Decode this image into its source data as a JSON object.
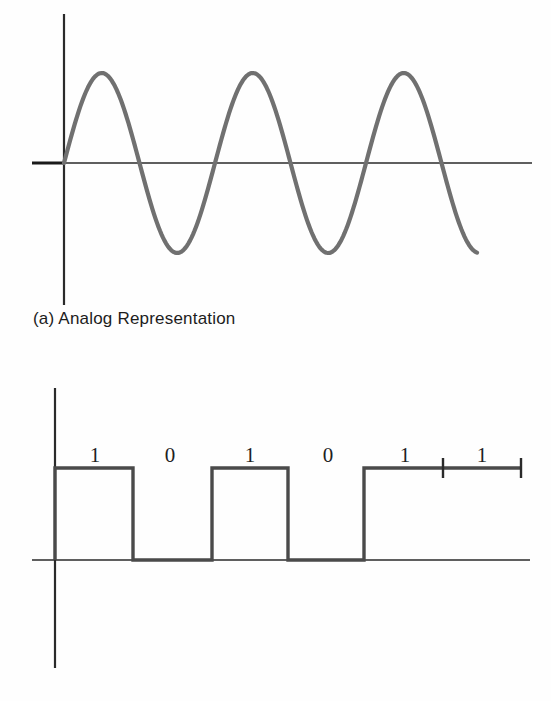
{
  "figure": {
    "background_color": "#fefefe",
    "panels": [
      {
        "id": "analog",
        "caption": "(a) Analog Representation"
      },
      {
        "id": "digital",
        "caption": "(b) Digital Representation"
      }
    ]
  },
  "analog": {
    "caption": "(a) Analog Representation",
    "wave_color": "#707070",
    "axis_color": "#2a2a2a",
    "axis": {
      "x_axis_start_x": 32,
      "x_axis_end_x": 532,
      "x_axis_y": 163,
      "y_axis_x": 64,
      "y_axis_top_y": 14,
      "y_axis_bottom_y": 305
    },
    "waveform": {
      "shape": "sine",
      "cycles": 3,
      "start_x": 64,
      "end_x": 477,
      "period_px": 151,
      "amplitude_px": 90,
      "zero_crossings_x": [
        64,
        138,
        215,
        290,
        368,
        443
      ],
      "peaks_x": [
        97,
        253,
        405
      ],
      "peak_y": 73,
      "troughs_x": [
        176,
        330
      ],
      "trough_y": 250
    }
  },
  "digital": {
    "caption": "(b) Digital Representation",
    "trace_color": "#4a4a4a",
    "axis_color": "#2a2a2a",
    "bits": [
      "1",
      "0",
      "1",
      "0",
      "1",
      "1"
    ],
    "bit_label_x": [
      95,
      170,
      250,
      328,
      405,
      482
    ],
    "bit_label_y": 445,
    "axis": {
      "x_axis_start_x": 32,
      "x_axis_end_x": 530,
      "x_axis_y": 560,
      "y_axis_x": 55,
      "y_axis_top_y": 388,
      "y_axis_bottom_y": 668
    },
    "waveform": {
      "shape": "square",
      "high_y": 468,
      "low_y": 560,
      "transitions_x": [
        55,
        133,
        212,
        288,
        364,
        521
      ],
      "levels": [
        "high",
        "low",
        "high",
        "low",
        "high"
      ],
      "end_x": 521,
      "ticks_x": [
        443,
        521
      ]
    }
  }
}
